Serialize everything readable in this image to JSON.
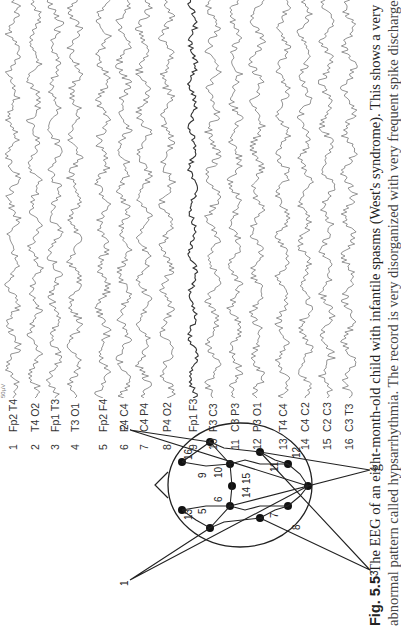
{
  "figure": {
    "number": "Fig. 5.5",
    "caption_line1": "The EEG of an eight-month-old child with infantile spasms (West's syndrome). This shows a very",
    "caption_line2": "abnormal pattern called hypsarrhythmia. The record is very disorganized with very frequent spike discharges"
  },
  "channels": [
    {
      "num": "1",
      "label": "Fp2 T4"
    },
    {
      "num": "2",
      "label": "T4 O2"
    },
    {
      "num": "3",
      "label": "Fp1 T3"
    },
    {
      "num": "4",
      "label": "T3 O1"
    },
    {
      "num": "5",
      "label": "Fp2 F4"
    },
    {
      "num": "6",
      "label": "F4 C4"
    },
    {
      "num": "7",
      "label": "C4 P4"
    },
    {
      "num": "8",
      "label": "P4 O2"
    },
    {
      "num": "9",
      "label": "Fp1 F3"
    },
    {
      "num": "10",
      "label": "F3 C3"
    },
    {
      "num": "11",
      "label": "C3 P3"
    },
    {
      "num": "12",
      "label": "P3 O1"
    },
    {
      "num": "13",
      "label": "T4 C4"
    },
    {
      "num": "14",
      "label": "C4 C2"
    },
    {
      "num": "15",
      "label": "C2 C3"
    },
    {
      "num": "16",
      "label": "C3 T3"
    }
  ],
  "montage": {
    "pointer_labels": [
      "1",
      "2",
      "3",
      "4"
    ],
    "electrode_numbers": [
      "5",
      "6",
      "7",
      "8",
      "9",
      "10",
      "11",
      "12",
      "13",
      "14",
      "15",
      "16"
    ]
  },
  "scale": {
    "calibration": "50µV"
  }
}
